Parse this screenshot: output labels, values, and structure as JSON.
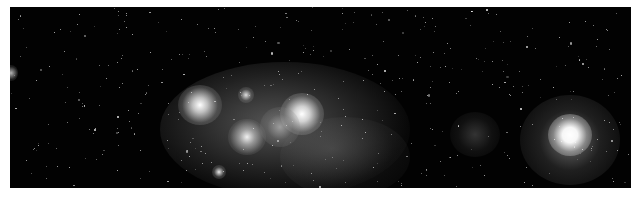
{
  "image": {
    "description": "Grayscale astronomical image of a star-forming nebula complex with scattered field stars and a bright isolated star at right",
    "background_color": "#020202",
    "frame": {
      "x": 10,
      "y": 7,
      "width": 621,
      "height": 181
    }
  },
  "features": {
    "nebula_complex": {
      "label": "Bright nebula complex",
      "center": [
        250,
        110
      ]
    },
    "bright_star": {
      "label": "Bright isolated star",
      "center": [
        566,
        128
      ]
    },
    "faint_cloud": {
      "label": "Faint cloud",
      "center": [
        467,
        130
      ]
    },
    "edge_source": {
      "label": "Edge source",
      "center": [
        12,
        73
      ]
    }
  }
}
